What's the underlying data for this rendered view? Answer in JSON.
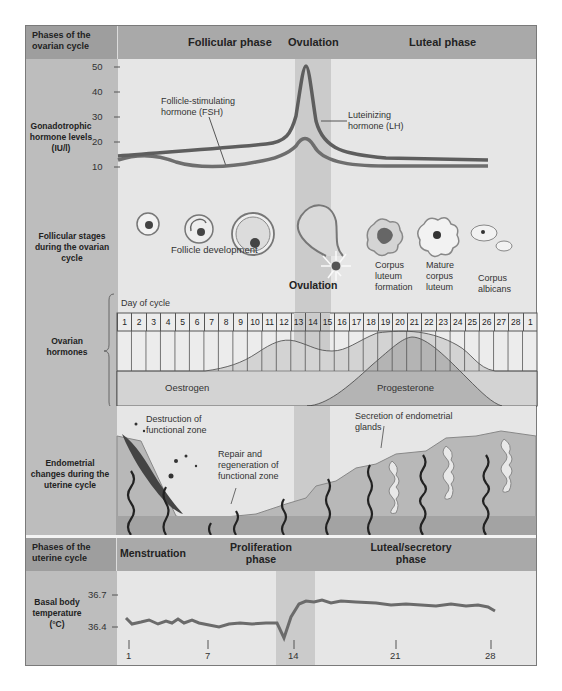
{
  "ovarian_header": {
    "label": "Phases of the ovarian cycle",
    "phases": [
      "Follicular phase",
      "Ovulation",
      "Luteal phase"
    ]
  },
  "gonadotrophic": {
    "label": "Gonadotrophic hormone levels (IU/l)",
    "y_ticks": [
      "50",
      "40",
      "30",
      "20",
      "10"
    ],
    "fsh_label": "Follicle-stimulating hormone (FSH)",
    "lh_label": "Luteinizing hormone (LH)"
  },
  "follicular": {
    "label": "Follicular stages during the ovarian cycle",
    "development_label": "Follicle development",
    "ovulation_label": "Ovulation",
    "stages": [
      "Corpus luteum formation",
      "Mature corpus luteum",
      "Corpus albicans"
    ]
  },
  "ovarian_hormones": {
    "label": "Ovarian hormones",
    "day_of_cycle_label": "Day of cycle",
    "days": [
      "1",
      "2",
      "3",
      "4",
      "5",
      "6",
      "7",
      "8",
      "9",
      "10",
      "11",
      "12",
      "13",
      "14",
      "15",
      "16",
      "17",
      "18",
      "19",
      "20",
      "21",
      "22",
      "23",
      "24",
      "25",
      "26",
      "27",
      "28",
      "1"
    ],
    "oestrogen_label": "Oestrogen",
    "progesterone_label": "Progesterone"
  },
  "endometrial": {
    "label": "Endometrial changes during the uterine cycle",
    "destruction_label": "Destruction of functional zone",
    "repair_label": "Repair and regeneration of functional zone",
    "secretion_label": "Secretion of endometrial glands"
  },
  "uterine_header": {
    "label": "Phases of the uterine cycle",
    "phases": [
      "Menstruation",
      "Proliferation phase",
      "Luteal/secretory phase"
    ]
  },
  "bbt": {
    "label": "Basal body temperature (°C)",
    "y_ticks": [
      "36.7",
      "36.4"
    ],
    "x_ticks": [
      "1",
      "7",
      "14",
      "21",
      "28"
    ]
  },
  "chart_data": [
    {
      "type": "line",
      "title": "Gonadotrophic hormone levels",
      "ylabel": "IU/l",
      "ylim": [
        10,
        50
      ],
      "x": [
        1,
        4,
        7,
        10,
        12,
        13,
        14,
        15,
        16,
        18,
        21,
        24,
        28
      ],
      "series": [
        {
          "name": "Luteinizing hormone (LH)",
          "values": [
            14,
            14.5,
            15,
            16,
            17,
            22,
            50,
            24,
            17,
            14,
            13,
            12.5,
            12
          ]
        },
        {
          "name": "Follicle-stimulating hormone (FSH)",
          "values": [
            16,
            14,
            11,
            11,
            12,
            15,
            22,
            15,
            11,
            11,
            11,
            12,
            12
          ]
        }
      ]
    },
    {
      "type": "area",
      "title": "Ovarian hormones",
      "xlabel": "Day of cycle",
      "x": [
        1,
        5,
        7,
        9,
        11,
        12,
        13,
        14,
        15,
        17,
        19,
        21,
        23,
        25,
        27,
        28
      ],
      "series": [
        {
          "name": "Oestrogen",
          "values": [
            0,
            0,
            0.5,
            1.5,
            4,
            4.8,
            4.2,
            3,
            2.8,
            3.8,
            5.2,
            5.6,
            4.5,
            2.2,
            0.3,
            0.3
          ]
        },
        {
          "name": "Progesterone",
          "values": [
            0,
            0,
            0,
            0,
            0,
            0,
            0,
            0.2,
            0.8,
            2.5,
            4.2,
            5,
            4,
            2,
            0.2,
            0
          ]
        }
      ]
    },
    {
      "type": "line",
      "title": "Basal body temperature",
      "ylabel": "°C",
      "ylim": [
        36.3,
        36.8
      ],
      "x": [
        1,
        2,
        3,
        4,
        5,
        6,
        7,
        8,
        9,
        10,
        11,
        12,
        13,
        14,
        15,
        16,
        17,
        18,
        19,
        20,
        21,
        22,
        23,
        24,
        25,
        26,
        27,
        28
      ],
      "series": [
        {
          "name": "Temperature",
          "values": [
            36.46,
            36.42,
            36.43,
            36.42,
            36.43,
            36.42,
            36.43,
            36.41,
            36.38,
            36.4,
            36.4,
            36.4,
            36.4,
            36.32,
            36.66,
            36.71,
            36.72,
            36.74,
            36.74,
            36.74,
            36.72,
            36.71,
            36.72,
            36.71,
            36.71,
            36.72,
            36.7,
            36.66
          ]
        }
      ]
    }
  ]
}
